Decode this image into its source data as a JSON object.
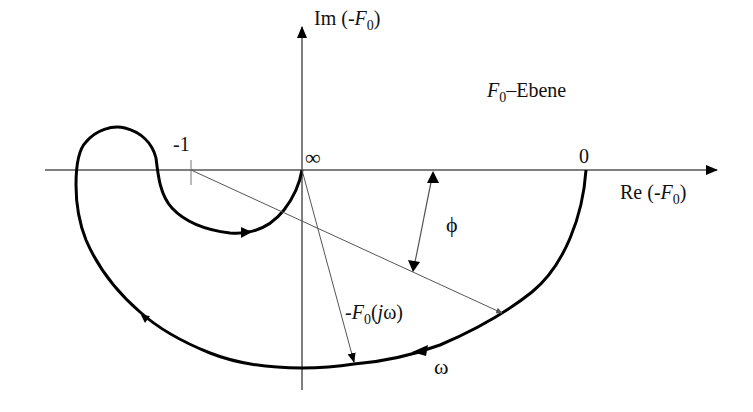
{
  "diagram": {
    "plane_label": {
      "main": "F",
      "sub": "0",
      "rest": "–Ebene"
    },
    "axes": {
      "x_label": {
        "prefix": "Re (-",
        "var": "F",
        "sub": "0",
        "suffix": ")"
      },
      "y_label": {
        "prefix": "Im (-",
        "var": "F",
        "sub": "0",
        "suffix": ")"
      }
    },
    "points": {
      "minus_one": "-1",
      "origin_infinity": "∞",
      "zero": "0"
    },
    "vector_label": {
      "prefix": "-",
      "var": "F",
      "sub": "0",
      "arg_open": "(",
      "arg_var": "j",
      "arg_omega": "ω",
      "arg_close": ")"
    },
    "angle_label": "ϕ",
    "direction_label": "ω",
    "colors": {
      "curve": "#000000",
      "axis": "#555555",
      "text": "#111111",
      "background": "#ffffff"
    }
  }
}
